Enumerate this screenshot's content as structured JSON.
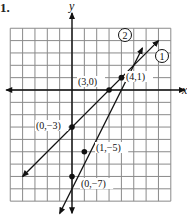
{
  "problem": {
    "number": "1."
  },
  "axes": {
    "x_label": "x",
    "y_label": "y"
  },
  "grid": {
    "x_min": -5,
    "x_max": 8,
    "y_min": -9,
    "y_max": 5,
    "unit_px": 12.35,
    "origin_px": [
      72,
      90
    ]
  },
  "lines": [
    {
      "id": "1",
      "label": "①",
      "circle_label": "1",
      "from": [
        -4,
        -7
      ],
      "to": [
        7,
        4
      ],
      "points": [
        {
          "x": 0,
          "y": -3,
          "label": "(0,−3)"
        },
        {
          "x": 3,
          "y": 0,
          "label": "(3,0)"
        }
      ]
    },
    {
      "id": "2",
      "label": "②",
      "circle_label": "2",
      "from": [
        -1,
        -10
      ],
      "to": [
        5.7,
        3.4
      ],
      "points": [
        {
          "x": 0,
          "y": -7,
          "label": "(0,−7)"
        },
        {
          "x": 1,
          "y": -5,
          "label": "(1,−5)"
        }
      ]
    }
  ],
  "intersection": {
    "x": 4,
    "y": 1,
    "label": "(4,1)"
  },
  "labels": {
    "p_3_0": "(3,0)",
    "p_4_1": "(4,1)",
    "p_0_m3": "(0,−3)",
    "p_1_m5": "(1,−5)",
    "p_0_m7": "(0,−7)",
    "line1": "1",
    "line2": "2"
  }
}
